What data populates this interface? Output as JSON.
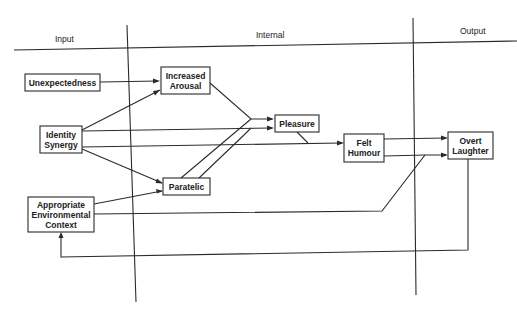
{
  "diagram": {
    "type": "flow-diagram",
    "sections": {
      "input": "Input",
      "internal": "Internal",
      "output": "Output"
    },
    "nodes": {
      "unexpectedness": [
        "Unexpectedness"
      ],
      "identity_synergy": [
        "Identity",
        "Synergy"
      ],
      "appropriate_context": [
        "Appropriate",
        "Environmental",
        "Context"
      ],
      "increased_arousal": [
        "Increased",
        "Arousal"
      ],
      "paratelic": [
        "Paratelic"
      ],
      "pleasure": [
        "Pleasure"
      ],
      "felt_humour": [
        "Felt",
        "Humour"
      ],
      "overt_laughter": [
        "Overt",
        "Laughter"
      ]
    },
    "edges": [
      {
        "from": "Unexpectedness",
        "to": "Increased Arousal"
      },
      {
        "from": "Identity Synergy",
        "to": "Increased Arousal"
      },
      {
        "from": "Identity Synergy",
        "to": "Pleasure"
      },
      {
        "from": "Identity Synergy",
        "to": "Felt Humour"
      },
      {
        "from": "Identity Synergy",
        "to": "Paratelic"
      },
      {
        "from": "Appropriate Environmental Context",
        "to": "Paratelic"
      },
      {
        "from": "Appropriate Environmental Context",
        "to": "Overt Laughter"
      },
      {
        "from": "Increased Arousal",
        "to": "Pleasure"
      },
      {
        "from": "Paratelic",
        "to": "Pleasure"
      },
      {
        "from": "Pleasure",
        "to": "Felt Humour"
      },
      {
        "from": "Felt Humour",
        "to": "Overt Laughter"
      },
      {
        "from": "Overt Laughter",
        "to": "Appropriate Environmental Context"
      }
    ]
  }
}
